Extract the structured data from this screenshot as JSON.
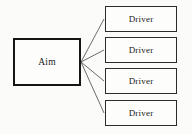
{
  "diagram": {
    "type": "fan-out-tree",
    "background_color": "#fbfbfa",
    "root": {
      "label": "Aim",
      "border_color": "#151515",
      "fill_color": "#fdfdfc"
    },
    "children": [
      {
        "label": "Driver"
      },
      {
        "label": "Driver"
      },
      {
        "label": "Driver"
      },
      {
        "label": "Driver"
      }
    ],
    "connectors": {
      "count": 4,
      "color": "#5a5a5a",
      "origin": {
        "x": 81,
        "y": 62
      },
      "endpoints": [
        {
          "x": 104,
          "y": 19
        },
        {
          "x": 104,
          "y": 50
        },
        {
          "x": 104,
          "y": 81
        },
        {
          "x": 104,
          "y": 113
        }
      ]
    }
  }
}
